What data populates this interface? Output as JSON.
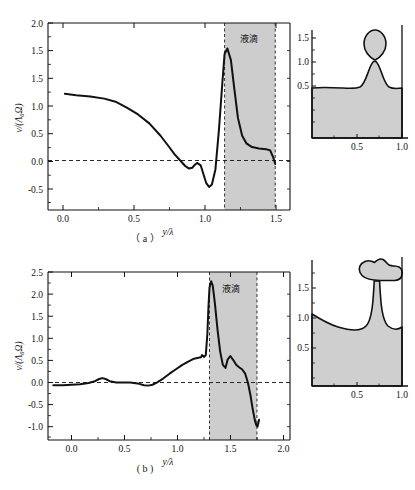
{
  "figure": {
    "type": "scientific-figure",
    "panel_count": 2
  },
  "chart_data": [
    {
      "id": "panel-a",
      "type": "line",
      "title": "",
      "caption": "（ a ）",
      "xlabel": "y/λ",
      "ylabel": "v/(Λ₀Ω)",
      "xlim": [
        -0.1,
        1.62
      ],
      "ylim": [
        -0.72,
        2.0
      ],
      "xticks": [
        0.0,
        0.5,
        1.0,
        1.5
      ],
      "xticklabels": [
        "0.0",
        "0.5",
        "1.0",
        "1.5"
      ],
      "yticks": [
        -0.5,
        0.0,
        0.5,
        1.0,
        1.5,
        2.0
      ],
      "yticklabels": [
        "-0.5",
        "0.0",
        "0.5",
        "1.0",
        "1.5",
        "2.0"
      ],
      "grid": false,
      "legend": null,
      "zero_reference_line": 0.0,
      "annotations": [
        {
          "text": "液滴",
          "x": 1.33,
          "y": 1.72,
          "meaning": "droplet-region-label"
        }
      ],
      "shaded_band": {
        "x_start": 1.155,
        "x_end": 1.515,
        "color": "#c9c9c9",
        "edge_style": "dashed"
      },
      "x": [
        0.02,
        0.1,
        0.2,
        0.3,
        0.38,
        0.46,
        0.54,
        0.62,
        0.7,
        0.76,
        0.8,
        0.84,
        0.875,
        0.9,
        0.925,
        0.945,
        0.96,
        0.985,
        1.005,
        1.025,
        1.045,
        1.065,
        1.09,
        1.115,
        1.14,
        1.155,
        1.175,
        1.2,
        1.225,
        1.25,
        1.28,
        1.31,
        1.35,
        1.4,
        1.45,
        1.48,
        1.5,
        1.515
      ],
      "y": [
        0.97,
        0.95,
        0.93,
        0.9,
        0.855,
        0.77,
        0.67,
        0.54,
        0.36,
        0.2,
        0.09,
        0.0,
        -0.08,
        -0.115,
        -0.105,
        -0.06,
        -0.035,
        -0.07,
        -0.2,
        -0.33,
        -0.385,
        -0.35,
        -0.13,
        0.45,
        1.15,
        1.55,
        1.63,
        1.46,
        1.03,
        0.62,
        0.36,
        0.25,
        0.195,
        0.175,
        0.165,
        0.145,
        0.05,
        -0.05
      ]
    },
    {
      "id": "panel-b",
      "type": "line",
      "title": "",
      "caption": "( b )",
      "xlabel": "y/λ",
      "ylabel": "v/(Λ₀Ω)",
      "xlim": [
        -0.22,
        2.05
      ],
      "ylim": [
        -1.3,
        2.5
      ],
      "xticks": [
        0.0,
        0.5,
        1.0,
        1.5,
        2.0
      ],
      "xticklabels": [
        "0.0",
        "0.5",
        "1.0",
        "1.5",
        "2.0"
      ],
      "yticks": [
        -1.0,
        -0.5,
        0.0,
        0.5,
        1.0,
        1.5,
        2.0,
        2.5
      ],
      "yticklabels": [
        "-1.0",
        "-0.5",
        "0.0",
        "0.5",
        "1.0",
        "1.5",
        "2.0",
        "2.5"
      ],
      "grid": false,
      "legend": null,
      "zero_reference_line": 0.0,
      "annotations": [
        {
          "text": "液滴",
          "x": 1.5,
          "y": 2.06,
          "meaning": "droplet-region-label"
        }
      ],
      "shaded_band": {
        "x_start": 1.295,
        "x_end": 1.74,
        "color": "#c9c9c9",
        "edge_style": "dashed"
      },
      "x": [
        -0.17,
        -0.08,
        0.0,
        0.08,
        0.16,
        0.22,
        0.26,
        0.29,
        0.32,
        0.36,
        0.42,
        0.48,
        0.55,
        0.62,
        0.68,
        0.72,
        0.76,
        0.8,
        0.86,
        0.92,
        0.98,
        1.04,
        1.1,
        1.15,
        1.19,
        1.215,
        1.225,
        1.245,
        1.26,
        1.275,
        1.285,
        1.295,
        1.31,
        1.325,
        1.345,
        1.37,
        1.395,
        1.42,
        1.445,
        1.465,
        1.49,
        1.515,
        1.545,
        1.575,
        1.6,
        1.63,
        1.655,
        1.68,
        1.7,
        1.72,
        1.735,
        1.745,
        1.76
      ],
      "y": [
        -0.06,
        -0.06,
        -0.05,
        -0.04,
        -0.01,
        0.03,
        0.08,
        0.1,
        0.08,
        0.03,
        0.0,
        0.0,
        0.0,
        -0.02,
        -0.06,
        -0.07,
        -0.05,
        0.0,
        0.09,
        0.2,
        0.3,
        0.4,
        0.48,
        0.54,
        0.56,
        0.57,
        0.62,
        0.58,
        0.62,
        1.1,
        1.7,
        2.15,
        2.29,
        2.2,
        1.8,
        1.2,
        0.7,
        0.4,
        0.33,
        0.52,
        0.6,
        0.52,
        0.4,
        0.34,
        0.3,
        0.2,
        0.0,
        -0.3,
        -0.6,
        -0.85,
        -0.97,
        -1.0,
        -0.84
      ]
    }
  ],
  "insets": [
    {
      "id": "inset-a",
      "belongs_to": "panel-a",
      "description": "interface-profile-with-detaching-droplet",
      "xticks": [
        0.5,
        1.0
      ],
      "xticklabels": [
        "0.5",
        "1.0"
      ],
      "yticks": [
        0.5,
        1.0,
        1.5
      ],
      "yticklabels": [
        "0.5",
        "1.0",
        "1.5"
      ],
      "film_level": 0.72,
      "droplet_center": [
        0.73,
        1.3
      ],
      "droplet_radius": 0.22
    },
    {
      "id": "inset-b",
      "belongs_to": "panel-b",
      "description": "interface-profile-with-elongated-neck-and-droplet",
      "xticks": [
        0.5,
        1.0
      ],
      "xticklabels": [
        "0.5",
        "1.0"
      ],
      "yticks": [
        0.5,
        1.0,
        1.5
      ],
      "yticklabels": [
        "0.5",
        "1.0",
        "1.5"
      ],
      "film_level": 0.52,
      "droplet_center": [
        0.8,
        1.68
      ]
    }
  ],
  "colors": {
    "curve": "#111111",
    "band_fill": "#c9c9c9",
    "fluid_fill": "#cfcfcf",
    "axis": "#111111"
  }
}
